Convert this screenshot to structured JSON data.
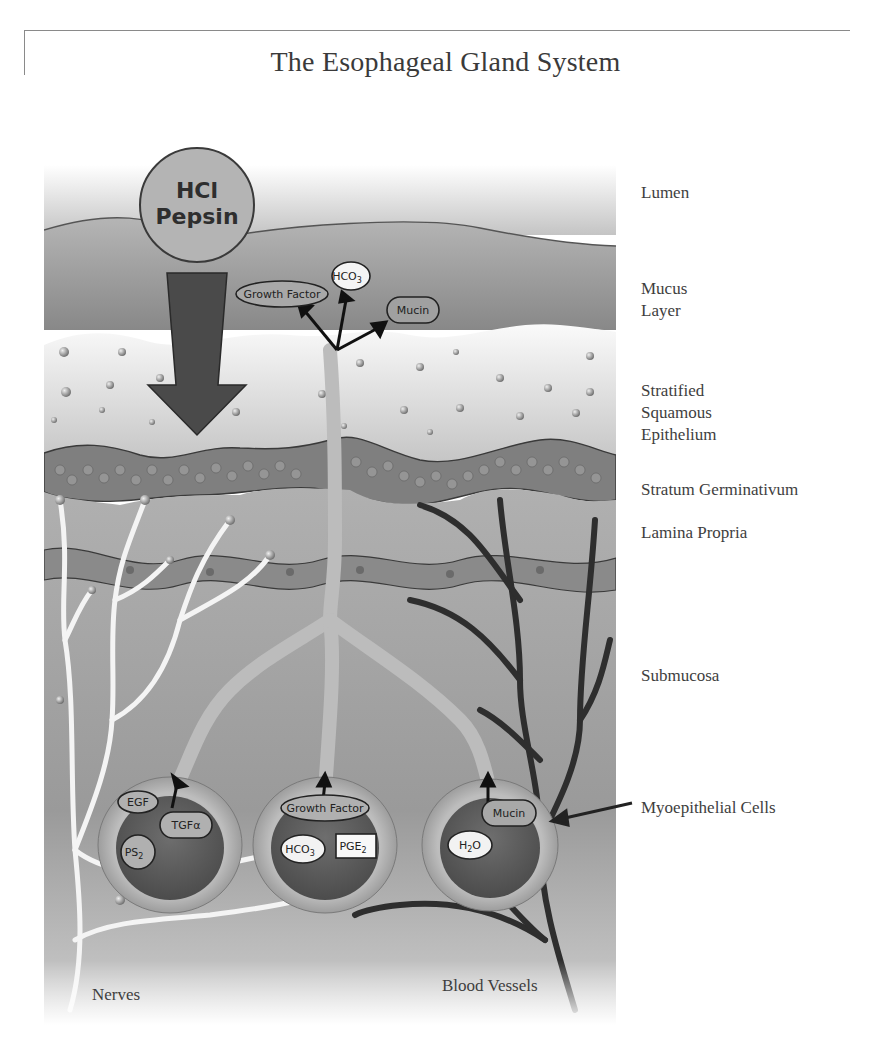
{
  "title": "The Esophageal Gland System",
  "top_circle": {
    "line1": "HCl",
    "line2": "Pepsin"
  },
  "surface_secretions": [
    {
      "label": "Growth Factor"
    },
    {
      "label": "HCO",
      "sub": "3"
    },
    {
      "label": "Mucin"
    }
  ],
  "layers": [
    {
      "name": "Lumen"
    },
    {
      "name": "Mucus\nLayer"
    },
    {
      "name": "Stratified\nSquamous\nEpithelium"
    },
    {
      "name": "Stratum Germinativum"
    },
    {
      "name": "Lamina Propria"
    },
    {
      "name": "Submucosa"
    },
    {
      "name": "Myoepithelial Cells"
    }
  ],
  "glands": [
    {
      "items": [
        {
          "label": "EGF"
        },
        {
          "label": "TGFα"
        },
        {
          "label": "PS",
          "sub": "2"
        }
      ]
    },
    {
      "items": [
        {
          "label": "Growth Factor"
        },
        {
          "label": "HCO",
          "sub": "3"
        },
        {
          "label": "PGE",
          "sub": "2"
        }
      ]
    },
    {
      "items": [
        {
          "label": "Mucin"
        },
        {
          "label": "H",
          "sub": "2",
          "tail": "O"
        }
      ]
    }
  ],
  "bottom_labels": {
    "nerves": "Nerves",
    "blood_vessels": "Blood Vessels"
  },
  "colors": {
    "lumen": "#c9c9c9",
    "mucus": "#9a9a9a",
    "epithelium": "#e6e6e6",
    "germinativum": "#7a7a7a",
    "lamina": "#a8a8a8",
    "submucosa": "#9c9c9c",
    "arrow": "#555555",
    "nerve": "#f2f2f2",
    "vessel": "#2e2e2e",
    "gland_core": "#5e5e5e"
  }
}
